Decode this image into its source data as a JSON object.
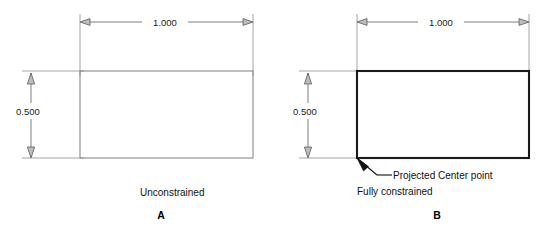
{
  "figure": {
    "background_color": "#ffffff",
    "panels": [
      {
        "id": "panel-a",
        "letter": "A",
        "caption": "Unconstrained",
        "geometry_style": "thin-gray",
        "width_dimension": "1.000",
        "height_dimension": "0.500",
        "notes": []
      },
      {
        "id": "panel-b",
        "letter": "B",
        "caption": "Fully constrained",
        "geometry_style": "thick-black",
        "width_dimension": "1.000",
        "height_dimension": "0.500",
        "notes": [
          "Projected Center point"
        ]
      }
    ],
    "colors": {
      "thin_geometry": "#8a8a8a",
      "thick_geometry": "#1a1a1a",
      "dimension_line": "#6f6f6f",
      "extension_line": "#9a9a9a",
      "text": "#111111",
      "arrow_open_fill": "#bdbdbd",
      "arrow_solid_fill": "#111111"
    },
    "labels": {
      "panel_a_letter": "A",
      "panel_b_letter": "B",
      "panel_a_caption": "Unconstrained",
      "panel_b_caption_note": "Projected Center point",
      "panel_b_caption": "Fully constrained",
      "width_a": "1.000",
      "height_a": "0.500",
      "width_b": "1.000",
      "height_b": "0.500"
    }
  }
}
